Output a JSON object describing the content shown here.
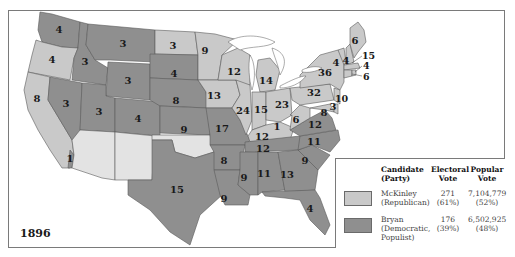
{
  "map": {
    "year": "1896",
    "colors": {
      "mckinley": "#c9c9c9",
      "bryan": "#8f8f8f",
      "border": "#5a5a5a"
    },
    "states": [
      {
        "name": "Washington",
        "party": "bryan",
        "votes": "4"
      },
      {
        "name": "Oregon",
        "party": "mckinley",
        "votes": "4"
      },
      {
        "name": "California",
        "party": "mckinley",
        "votes": "8"
      },
      {
        "name": "California (1 Bryan elector)",
        "party": "bryan",
        "votes": "1"
      },
      {
        "name": "Idaho",
        "party": "bryan",
        "votes": "3"
      },
      {
        "name": "Nevada",
        "party": "bryan",
        "votes": "3"
      },
      {
        "name": "Montana",
        "party": "bryan",
        "votes": "3"
      },
      {
        "name": "Wyoming",
        "party": "bryan",
        "votes": "3"
      },
      {
        "name": "Utah",
        "party": "bryan",
        "votes": "3"
      },
      {
        "name": "Colorado",
        "party": "bryan",
        "votes": "4"
      },
      {
        "name": "North Dakota",
        "party": "mckinley",
        "votes": "3"
      },
      {
        "name": "South Dakota",
        "party": "bryan",
        "votes": "4"
      },
      {
        "name": "Nebraska",
        "party": "bryan",
        "votes": "8"
      },
      {
        "name": "Kansas",
        "party": "bryan",
        "votes": "9"
      },
      {
        "name": "Texas",
        "party": "bryan",
        "votes": "15"
      },
      {
        "name": "Minnesota",
        "party": "mckinley",
        "votes": "9"
      },
      {
        "name": "Iowa",
        "party": "mckinley",
        "votes": "13"
      },
      {
        "name": "Missouri",
        "party": "bryan",
        "votes": "17"
      },
      {
        "name": "Arkansas",
        "party": "bryan",
        "votes": "8"
      },
      {
        "name": "Louisiana",
        "party": "bryan",
        "votes": "9"
      },
      {
        "name": "Wisconsin",
        "party": "mckinley",
        "votes": "12"
      },
      {
        "name": "Illinois",
        "party": "mckinley",
        "votes": "24"
      },
      {
        "name": "Michigan",
        "party": "mckinley",
        "votes": "14"
      },
      {
        "name": "Indiana",
        "party": "mckinley",
        "votes": "15"
      },
      {
        "name": "Ohio",
        "party": "mckinley",
        "votes": "23"
      },
      {
        "name": "Kentucky",
        "party": "mckinley",
        "votes": "12"
      },
      {
        "name": "Kentucky (1 Bryan elector)",
        "party": "bryan",
        "votes": "1"
      },
      {
        "name": "Tennessee",
        "party": "bryan",
        "votes": "12"
      },
      {
        "name": "Mississippi",
        "party": "bryan",
        "votes": "9"
      },
      {
        "name": "Alabama",
        "party": "bryan",
        "votes": "11"
      },
      {
        "name": "Georgia",
        "party": "bryan",
        "votes": "13"
      },
      {
        "name": "Florida",
        "party": "bryan",
        "votes": "4"
      },
      {
        "name": "South Carolina",
        "party": "bryan",
        "votes": "9"
      },
      {
        "name": "North Carolina",
        "party": "bryan",
        "votes": "11"
      },
      {
        "name": "Virginia",
        "party": "bryan",
        "votes": "12"
      },
      {
        "name": "West Virginia",
        "party": "mckinley",
        "votes": "6"
      },
      {
        "name": "Maryland",
        "party": "mckinley",
        "votes": "8"
      },
      {
        "name": "Delaware",
        "party": "mckinley",
        "votes": "3"
      },
      {
        "name": "Pennsylvania",
        "party": "mckinley",
        "votes": "32"
      },
      {
        "name": "New Jersey",
        "party": "mckinley",
        "votes": "10"
      },
      {
        "name": "New York",
        "party": "mckinley",
        "votes": "36"
      },
      {
        "name": "Vermont",
        "party": "mckinley",
        "votes": "4"
      },
      {
        "name": "New Hampshire",
        "party": "mckinley",
        "votes": "4"
      },
      {
        "name": "Maine",
        "party": "mckinley",
        "votes": "6"
      },
      {
        "name": "Massachusetts",
        "party": "mckinley",
        "votes": "15"
      },
      {
        "name": "Rhode Island",
        "party": "mckinley",
        "votes": "4"
      },
      {
        "name": "Connecticut",
        "party": "mckinley",
        "votes": "6"
      },
      {
        "name": "Arizona Territory",
        "party": "none",
        "votes": ""
      },
      {
        "name": "New Mexico Territory",
        "party": "none",
        "votes": ""
      },
      {
        "name": "Oklahoma Territory",
        "party": "none",
        "votes": ""
      },
      {
        "name": "Indian Territory",
        "party": "none",
        "votes": ""
      }
    ]
  },
  "legend": {
    "headers": {
      "candidate": "Candidate",
      "party": "(Party)",
      "electoral1": "Electoral",
      "electoral2": "Vote",
      "popular1": "Popular",
      "popular2": "Vote"
    },
    "rows": [
      {
        "name": "McKinley",
        "party": "(Republican)",
        "party2": "",
        "electoral": "271",
        "electoral_pct": "(61%)",
        "popular": "7,104,779",
        "popular_pct": "(52%)",
        "swatch": "#c9c9c9"
      },
      {
        "name": "Bryan",
        "party": "(Democratic,",
        "party2": "Populist)",
        "electoral": "176",
        "electoral_pct": "(39%)",
        "popular": "6,502,925",
        "popular_pct": "(48%)",
        "swatch": "#8f8f8f"
      }
    ]
  }
}
